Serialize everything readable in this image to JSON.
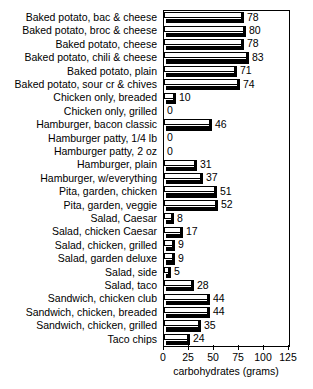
{
  "chart_data": {
    "type": "bar",
    "orientation": "horizontal",
    "title": "",
    "xlabel": "carbohydrates (grams)",
    "ylabel": "",
    "xlim": [
      0,
      125
    ],
    "xticks": [
      0,
      25,
      50,
      75,
      100,
      125
    ],
    "grid": false,
    "legend": null,
    "categories": [
      "Baked potato, bac & cheese",
      "Baked potato, broc & cheese",
      "Baked potato, cheese",
      "Baked potato, chili & cheese",
      "Baked potato, plain",
      "Baked potato, sour cr & chives",
      "Chicken only, breaded",
      "Chicken only, grilled",
      "Hamburger, bacon classic",
      "Hamburger patty, 1/4 lb",
      "Hamburger patty, 2 oz",
      "Hamburger, plain",
      "Hamburger, w/everything",
      "Pita, garden, chicken",
      "Pita, garden, veggie",
      "Salad, Caesar",
      "Salad, chicken Caesar",
      "Salad, chicken, grilled",
      "Salad, garden deluxe",
      "Salad, side",
      "Salad, taco",
      "Sandwich, chicken club",
      "Sandwich, chicken, breaded",
      "Sandwich, chicken, grilled",
      "Taco chips"
    ],
    "values": [
      78,
      80,
      78,
      83,
      71,
      74,
      10,
      0,
      46,
      0,
      0,
      31,
      37,
      51,
      52,
      8,
      17,
      9,
      9,
      5,
      28,
      44,
      44,
      35,
      24
    ]
  },
  "colors": {
    "bar_face": "#ffffff",
    "bar_outline": "#000000",
    "bar_shadow": "#000000",
    "axis": "#000000",
    "background": "#ffffff",
    "text": "#000000"
  }
}
